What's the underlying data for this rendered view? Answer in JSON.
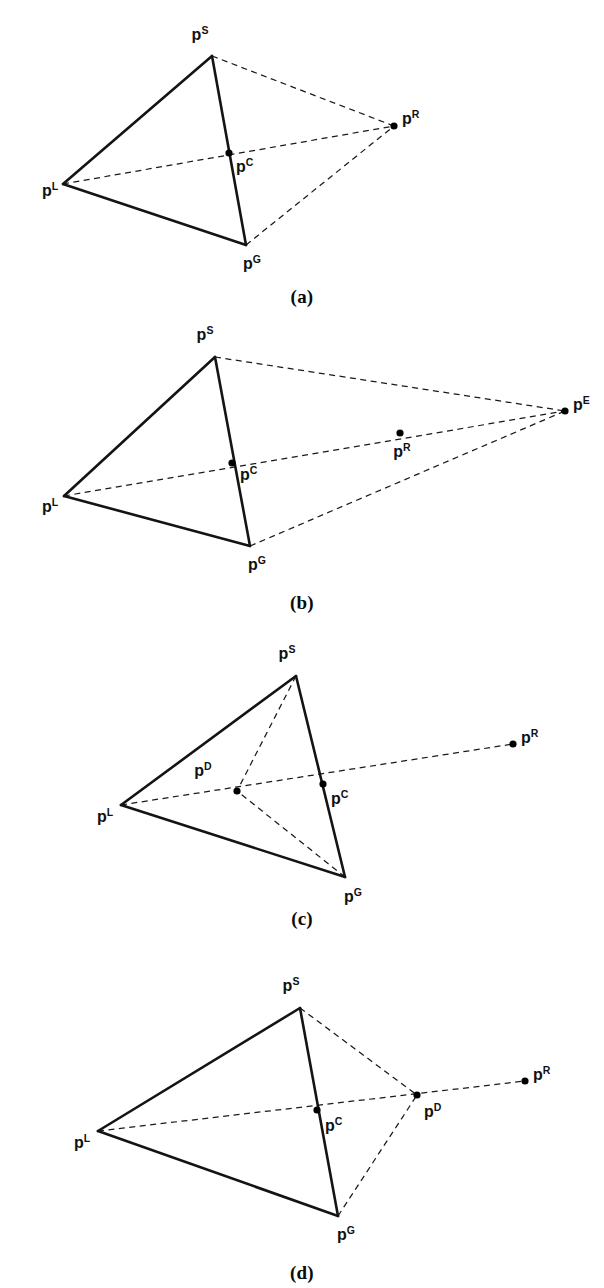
{
  "figure": {
    "background_color": "#ffffff",
    "ink_color": "#000000",
    "width": 604,
    "height": 1288
  },
  "labels": {
    "base": "p",
    "sup_S": "S",
    "sup_L": "L",
    "sup_G": "G",
    "sup_R": "R",
    "sup_C": "C",
    "sup_E": "E",
    "sup_D": "D"
  },
  "panels": [
    {
      "id": "a",
      "caption": "(a)",
      "caption_y": 286,
      "viewbox": "0 0 604 282",
      "top": 0,
      "height": 282,
      "solid_edges": [
        {
          "name": "edge-left-apex",
          "x1": 63,
          "y1": 184,
          "x2": 212,
          "y2": 56
        },
        {
          "name": "edge-left-ground",
          "x1": 63,
          "y1": 184,
          "x2": 246,
          "y2": 245
        },
        {
          "name": "edge-apex-ground",
          "x1": 212,
          "y1": 56,
          "x2": 246,
          "y2": 245
        }
      ],
      "dashed_edges": [
        {
          "name": "ray-apex-to-r",
          "x1": 212,
          "y1": 56,
          "x2": 394,
          "y2": 126
        },
        {
          "name": "ray-left-to-r",
          "x1": 63,
          "y1": 184,
          "x2": 394,
          "y2": 126
        },
        {
          "name": "ray-ground-to-r",
          "x1": 246,
          "y1": 245,
          "x2": 394,
          "y2": 126
        }
      ],
      "points": [
        {
          "name": "p-S",
          "sup": "S",
          "x": 212,
          "y": 56,
          "dot": false,
          "lx": 200,
          "ly": 40,
          "anchor": "middle"
        },
        {
          "name": "p-L",
          "sup": "L",
          "x": 63,
          "y": 184,
          "dot": false,
          "lx": 50,
          "ly": 196,
          "anchor": "middle"
        },
        {
          "name": "p-G",
          "sup": "G",
          "x": 246,
          "y": 245,
          "dot": false,
          "lx": 252,
          "ly": 269,
          "anchor": "middle"
        },
        {
          "name": "p-R",
          "sup": "R",
          "x": 394,
          "y": 126,
          "dot": true,
          "lx": 402,
          "ly": 124,
          "anchor": "start"
        },
        {
          "name": "p-C",
          "sup": "C",
          "x": 229,
          "y": 153,
          "dot": true,
          "lx": 236,
          "ly": 172,
          "anchor": "start"
        }
      ]
    },
    {
      "id": "b",
      "caption": "(b)",
      "caption_y": 592,
      "viewbox": "0 0 604 282",
      "top": 314,
      "height": 282,
      "solid_edges": [
        {
          "name": "edge-left-apex",
          "x1": 64,
          "y1": 182,
          "x2": 215,
          "y2": 43
        },
        {
          "name": "edge-left-ground",
          "x1": 64,
          "y1": 182,
          "x2": 250,
          "y2": 232
        },
        {
          "name": "edge-apex-ground",
          "x1": 215,
          "y1": 43,
          "x2": 250,
          "y2": 232
        }
      ],
      "dashed_edges": [
        {
          "name": "ray-apex-to-e",
          "x1": 215,
          "y1": 43,
          "x2": 565,
          "y2": 97
        },
        {
          "name": "ray-left-to-e",
          "x1": 64,
          "y1": 182,
          "x2": 565,
          "y2": 97
        },
        {
          "name": "ray-ground-to-e",
          "x1": 250,
          "y1": 232,
          "x2": 565,
          "y2": 97
        }
      ],
      "points": [
        {
          "name": "p-S",
          "sup": "S",
          "x": 215,
          "y": 43,
          "dot": false,
          "lx": 205,
          "ly": 26,
          "anchor": "middle"
        },
        {
          "name": "p-L",
          "sup": "L",
          "x": 64,
          "y": 182,
          "dot": false,
          "lx": 50,
          "ly": 198,
          "anchor": "middle"
        },
        {
          "name": "p-G",
          "sup": "G",
          "x": 250,
          "y": 232,
          "dot": false,
          "lx": 257,
          "ly": 256,
          "anchor": "middle"
        },
        {
          "name": "p-E",
          "sup": "E",
          "x": 565,
          "y": 97,
          "dot": true,
          "lx": 573,
          "ly": 96,
          "anchor": "start"
        },
        {
          "name": "p-R",
          "sup": "R",
          "x": 400,
          "y": 119,
          "dot": true,
          "lx": 402,
          "ly": 143,
          "anchor": "middle"
        },
        {
          "name": "p-C",
          "sup": "C",
          "x": 232,
          "y": 149,
          "dot": true,
          "lx": 240,
          "ly": 166,
          "anchor": "start"
        }
      ]
    },
    {
      "id": "c",
      "caption": "(c)",
      "caption_y": 908,
      "viewbox": "0 0 604 278",
      "top": 632,
      "height": 278,
      "solid_edges": [
        {
          "name": "edge-left-apex",
          "x1": 121,
          "y1": 173,
          "x2": 296,
          "y2": 44
        },
        {
          "name": "edge-left-ground",
          "x1": 121,
          "y1": 173,
          "x2": 345,
          "y2": 245
        },
        {
          "name": "edge-apex-ground",
          "x1": 296,
          "y1": 44,
          "x2": 345,
          "y2": 245
        }
      ],
      "dashed_edges": [
        {
          "name": "ray-left-to-r",
          "x1": 121,
          "y1": 173,
          "x2": 513,
          "y2": 112
        },
        {
          "name": "ray-apex-to-d",
          "x1": 296,
          "y1": 44,
          "x2": 237,
          "y2": 159
        },
        {
          "name": "ray-ground-to-d",
          "x1": 345,
          "y1": 245,
          "x2": 237,
          "y2": 159
        }
      ],
      "points": [
        {
          "name": "p-S",
          "sup": "S",
          "x": 296,
          "y": 44,
          "dot": false,
          "lx": 287,
          "ly": 27,
          "anchor": "middle"
        },
        {
          "name": "p-L",
          "sup": "L",
          "x": 121,
          "y": 173,
          "dot": false,
          "lx": 105,
          "ly": 190,
          "anchor": "middle"
        },
        {
          "name": "p-G",
          "sup": "G",
          "x": 345,
          "y": 245,
          "dot": false,
          "lx": 353,
          "ly": 270,
          "anchor": "middle"
        },
        {
          "name": "p-R",
          "sup": "R",
          "x": 513,
          "y": 112,
          "dot": true,
          "lx": 521,
          "ly": 111,
          "anchor": "start"
        },
        {
          "name": "p-C",
          "sup": "C",
          "x": 323,
          "y": 152,
          "dot": true,
          "lx": 331,
          "ly": 172,
          "anchor": "start"
        },
        {
          "name": "p-D",
          "sup": "D",
          "x": 237,
          "y": 159,
          "dot": true,
          "lx": 203,
          "ly": 144,
          "anchor": "middle"
        }
      ]
    },
    {
      "id": "d",
      "caption": "(d)",
      "caption_y": 1262,
      "viewbox": "0 0 604 294",
      "top": 962,
      "height": 294,
      "solid_edges": [
        {
          "name": "edge-left-apex",
          "x1": 98,
          "y1": 169,
          "x2": 300,
          "y2": 46
        },
        {
          "name": "edge-left-ground",
          "x1": 98,
          "y1": 169,
          "x2": 338,
          "y2": 254
        },
        {
          "name": "edge-apex-ground",
          "x1": 300,
          "y1": 46,
          "x2": 338,
          "y2": 254
        }
      ],
      "dashed_edges": [
        {
          "name": "ray-left-to-r",
          "x1": 98,
          "y1": 169,
          "x2": 525,
          "y2": 119
        },
        {
          "name": "ray-apex-to-d",
          "x1": 300,
          "y1": 46,
          "x2": 417,
          "y2": 133
        },
        {
          "name": "ray-ground-to-d",
          "x1": 338,
          "y1": 254,
          "x2": 417,
          "y2": 133
        }
      ],
      "points": [
        {
          "name": "p-S",
          "sup": "S",
          "x": 300,
          "y": 46,
          "dot": false,
          "lx": 291,
          "ly": 29,
          "anchor": "middle"
        },
        {
          "name": "p-L",
          "sup": "L",
          "x": 98,
          "y": 169,
          "dot": false,
          "lx": 82,
          "ly": 186,
          "anchor": "middle"
        },
        {
          "name": "p-G",
          "sup": "G",
          "x": 338,
          "y": 254,
          "dot": false,
          "lx": 346,
          "ly": 278,
          "anchor": "middle"
        },
        {
          "name": "p-R",
          "sup": "R",
          "x": 525,
          "y": 119,
          "dot": true,
          "lx": 533,
          "ly": 118,
          "anchor": "start"
        },
        {
          "name": "p-C",
          "sup": "C",
          "x": 317,
          "y": 148,
          "dot": true,
          "lx": 325,
          "ly": 169,
          "anchor": "start"
        },
        {
          "name": "p-D",
          "sup": "D",
          "x": 417,
          "y": 133,
          "dot": true,
          "lx": 424,
          "ly": 155,
          "anchor": "start"
        }
      ]
    }
  ]
}
